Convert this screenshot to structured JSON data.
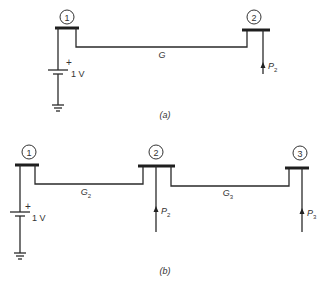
{
  "diagram_a": {
    "caption": "(a)",
    "buses": [
      {
        "id": "1",
        "label": "1"
      },
      {
        "id": "2",
        "label": "2"
      }
    ],
    "line_label": "G",
    "source": {
      "plus": "+",
      "voltage": "1 V"
    },
    "injections": [
      {
        "bus": "2",
        "label": "P",
        "sub": "2"
      }
    ]
  },
  "diagram_b": {
    "caption": "(b)",
    "buses": [
      {
        "id": "1",
        "label": "1"
      },
      {
        "id": "2",
        "label": "2"
      },
      {
        "id": "3",
        "label": "3"
      }
    ],
    "line_labels": [
      {
        "label": "G",
        "sub": "2"
      },
      {
        "label": "G",
        "sub": "3"
      }
    ],
    "source": {
      "plus": "+",
      "voltage": "1 V"
    },
    "injections": [
      {
        "bus": "2",
        "label": "P",
        "sub": "2"
      },
      {
        "bus": "3",
        "label": "P",
        "sub": "3"
      }
    ]
  }
}
